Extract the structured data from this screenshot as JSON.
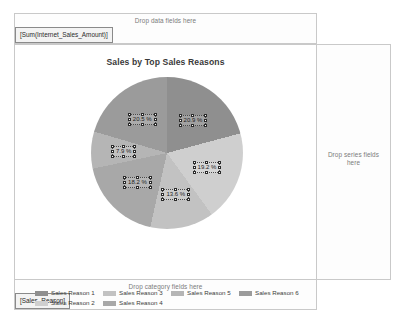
{
  "designer": {
    "data_zone": {
      "hint": "Drop data fields here",
      "chip": "[Sum(Internet_Sales_Amount)]"
    },
    "series_zone": {
      "hint": "Drop series fields here"
    },
    "category_zone": {
      "hint": "Drop category fields here",
      "chip": "[Sales_Reason]"
    }
  },
  "chart_data": {
    "type": "pie",
    "title": "Sales by Top Sales Reasons",
    "xlabel": "",
    "ylabel": "",
    "legend_position": "bottom",
    "grid": false,
    "categories": [
      "Sales Reason 1",
      "Sales Reason 2",
      "Sales Reason 3",
      "Sales Reason 4",
      "Sales Reason 5",
      "Sales Reason 6"
    ],
    "values": [
      20.9,
      19.2,
      13.6,
      18.2,
      7.9,
      20.5
    ],
    "labels": [
      "20.9 %",
      "19.2 %",
      "13.6 %",
      "18.2 %",
      "7.9 %",
      "20.5 %"
    ],
    "colors": [
      "#8f8f8f",
      "#cfcfcf",
      "#c2c2c2",
      "#a8a8a8",
      "#b5b5b5",
      "#9b9b9b"
    ],
    "slices": [
      {
        "name": "Sales Reason 1",
        "label": "20.9 %",
        "value": 20.9,
        "color": "#8f8f8f"
      },
      {
        "name": "Sales Reason 2",
        "label": "19.2 %",
        "value": 19.2,
        "color": "#cfcfcf"
      },
      {
        "name": "Sales Reason 3",
        "label": "13.6 %",
        "value": 13.6,
        "color": "#c2c2c2"
      },
      {
        "name": "Sales Reason 4",
        "label": "18.2 %",
        "value": 18.2,
        "color": "#a8a8a8"
      },
      {
        "name": "Sales Reason 5",
        "label": "7.9 %",
        "value": 7.9,
        "color": "#b5b5b5"
      },
      {
        "name": "Sales Reason 6",
        "label": "20.5 %",
        "value": 20.5,
        "color": "#9b9b9b"
      }
    ]
  }
}
